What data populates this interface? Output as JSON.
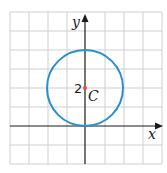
{
  "diagram": {
    "type": "coordinate-plane-circle",
    "grid": {
      "columns": 8,
      "rows": 8,
      "cell_px": 19,
      "origin_px": [
        10,
        12
      ],
      "color": "#cfcfcf"
    },
    "axes": {
      "x_label": "x",
      "y_label": "y",
      "x_axis_y_px": 126,
      "y_axis_x_px": 85,
      "color": "#1a1a1a"
    },
    "circle": {
      "center_label": "C",
      "center_value_label": "2",
      "center": [
        0,
        2
      ],
      "radius": 2,
      "color": "#2a8fcc"
    },
    "center_point_color": "#e0503a"
  }
}
